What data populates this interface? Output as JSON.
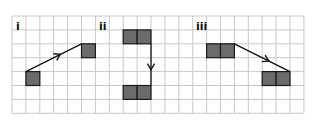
{
  "grid": {
    "left": 12,
    "top": 16,
    "cell": 13.9,
    "cols": 21,
    "rows": 7,
    "line_color": "#c8c8c8"
  },
  "colors": {
    "block_fill": "#6b6b6b",
    "block_stroke": "#1a1a1a",
    "arrow": "#111111"
  },
  "panels": [
    {
      "label": "i",
      "label_x": 16,
      "label_y": 30,
      "blocks": [
        {
          "col": 1,
          "row": 4,
          "w": 1
        },
        {
          "col": 5,
          "row": 2,
          "w": 1
        }
      ],
      "arrow": {
        "from": [
          1,
          4
        ],
        "to": [
          5,
          2
        ]
      }
    },
    {
      "label": "ii",
      "label_x": 99,
      "label_y": 30,
      "blocks": [
        {
          "col": 8,
          "row": 1,
          "w": 2
        },
        {
          "col": 8,
          "row": 5,
          "w": 2
        }
      ],
      "arrow": {
        "from": [
          10,
          2
        ],
        "to": [
          10,
          5
        ]
      }
    },
    {
      "label": "iii",
      "label_x": 196,
      "label_y": 30,
      "blocks": [
        {
          "col": 14,
          "row": 2,
          "w": 2
        },
        {
          "col": 18,
          "row": 4,
          "w": 2
        }
      ],
      "arrow": {
        "from": [
          16,
          2
        ],
        "to": [
          20,
          4
        ]
      }
    }
  ]
}
